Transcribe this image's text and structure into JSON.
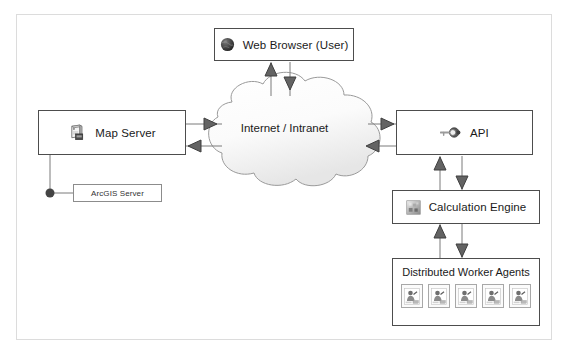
{
  "diagram": {
    "frame_color": "#dcdcdc",
    "node_border_color": "#4d4d4d",
    "arrow_color": "#555555",
    "nodes": {
      "browser": {
        "label": "Web Browser (User)",
        "icon": "globe-icon"
      },
      "mapserver": {
        "label": "Map Server",
        "icon": "server-icon"
      },
      "arcgis": {
        "label": "ArcGIS Server",
        "icon": "none"
      },
      "cloud": {
        "label": "Internet / Intranet",
        "icon": "cloud-shape"
      },
      "api": {
        "label": "API",
        "icon": "key-icon"
      },
      "calc": {
        "label": "Calculation Engine",
        "icon": "chip-icon"
      },
      "workers": {
        "label": "Distributed Worker Agents",
        "icon": "worker-agent-icon",
        "agent_count": 5,
        "agents": [
          {
            "name": "worker-agent-1"
          },
          {
            "name": "worker-agent-2"
          },
          {
            "name": "worker-agent-3"
          },
          {
            "name": "worker-agent-4"
          },
          {
            "name": "worker-agent-5"
          }
        ]
      }
    },
    "connections": [
      {
        "from": "browser",
        "to": "cloud",
        "direction": "bidirectional",
        "orientation": "vertical"
      },
      {
        "from": "mapserver",
        "to": "cloud",
        "direction": "bidirectional",
        "orientation": "horizontal"
      },
      {
        "from": "cloud",
        "to": "api",
        "direction": "bidirectional",
        "orientation": "horizontal"
      },
      {
        "from": "api",
        "to": "calc",
        "direction": "bidirectional",
        "orientation": "vertical"
      },
      {
        "from": "calc",
        "to": "workers",
        "direction": "bidirectional",
        "orientation": "vertical"
      },
      {
        "from": "mapserver",
        "to": "arcgis",
        "direction": "annotation",
        "orientation": "elbow"
      }
    ]
  }
}
